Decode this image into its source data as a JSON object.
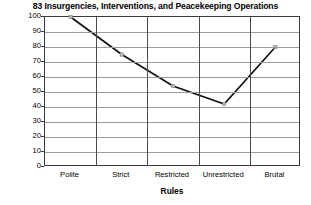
{
  "chart_data": {
    "type": "line",
    "title": "83 Insurgencies, Interventions, and Peacekeeping Operations",
    "xlabel": "Rules",
    "ylabel": "",
    "categories": [
      "Polite",
      "Strict",
      "Restricted",
      "Unrestricted",
      "Brutal"
    ],
    "values": [
      100,
      75,
      54,
      42,
      80
    ],
    "ylim": [
      0,
      100
    ],
    "yticks": [
      0,
      10,
      20,
      30,
      40,
      50,
      60,
      70,
      80,
      90,
      100
    ],
    "ytick_labels": [
      "0",
      "10",
      "20",
      "30",
      "40",
      "50",
      "60",
      "70",
      "80",
      "90",
      "100"
    ],
    "grid": "horizontal-and-vertical",
    "legend": "none",
    "series": [
      {
        "name": "Operations",
        "values": [
          100,
          75,
          54,
          42,
          80
        ],
        "line_color": "#111111",
        "marker_color": "#b9b9b9"
      }
    ],
    "colors": {
      "line": "#111111",
      "marker": "#b9b9b9",
      "grid_horizontal": "#9a9a9a",
      "grid_vertical": "#4a4a4a",
      "frame": "#3b3b3b",
      "background": "#ffffff",
      "text": "#000000"
    }
  }
}
